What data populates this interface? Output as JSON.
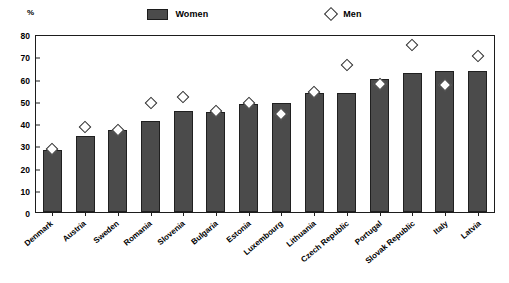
{
  "legend": {
    "women_label": "Women",
    "men_label": "Men",
    "women_swatch_color": "#4b4b4b",
    "men_marker_color": "#ffffff"
  },
  "axis": {
    "unit": "%",
    "yticks": [
      "0",
      "10",
      "20",
      "30",
      "40",
      "50",
      "60",
      "70",
      "80"
    ]
  },
  "chart_data": {
    "type": "bar",
    "title": "",
    "subtitle": "",
    "xlabel": "",
    "ylabel": "%",
    "ylim": [
      0,
      80
    ],
    "ytick_step": 10,
    "grid": false,
    "legend_position": "top-center",
    "categories": [
      "Denmark",
      "Austria",
      "Sweden",
      "Romania",
      "Slovenia",
      "Bulgaria",
      "Estonia",
      "Luxembourg",
      "Lithuania",
      "Czech Republic",
      "Portugal",
      "Slovak Republic",
      "Italy",
      "Latvia"
    ],
    "series": [
      {
        "name": "Women",
        "type": "bar",
        "values": [
          28,
          34,
          37,
          41,
          45.5,
          45,
          48.5,
          49,
          53.5,
          53.5,
          60,
          62.5,
          63.5,
          63.5
        ]
      },
      {
        "name": "Men",
        "type": "scatter",
        "marker": "open-diamond",
        "values": [
          28.5,
          38,
          37,
          49,
          51.5,
          45.5,
          49,
          44,
          54,
          66,
          57.5,
          75,
          57,
          70
        ]
      }
    ]
  }
}
